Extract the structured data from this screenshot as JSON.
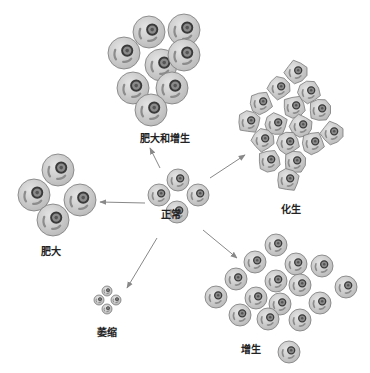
{
  "diagram": {
    "center": {
      "label": "正常",
      "meaning": "normal"
    },
    "branches": [
      {
        "id": "hypertrophy-hyperplasia",
        "label": "肥大和增生"
      },
      {
        "id": "metaplasia",
        "label": "化生"
      },
      {
        "id": "hypertrophy",
        "label": "肥大"
      },
      {
        "id": "atrophy",
        "label": "萎缩"
      },
      {
        "id": "hyperplasia",
        "label": "增生"
      }
    ],
    "colors": {
      "cell_fill": "#c9c9c9",
      "cell_outline": "#7a7a7a",
      "nucleus_fill": "#8a8a8a",
      "nucleus_ring": "#3a3a3a",
      "arrow": "#888888",
      "label": "#222222"
    }
  }
}
